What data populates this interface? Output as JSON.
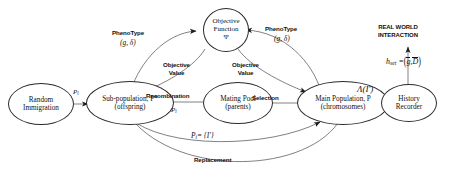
{
  "diagram": {
    "nodes": [
      {
        "id": "random-immigration",
        "lines": [
          "Random",
          "Immigration"
        ]
      },
      {
        "id": "sub-population",
        "lines": [
          "Sub-population, P*",
          "(offspring)"
        ]
      },
      {
        "id": "mating-pool",
        "lines": [
          "Mating Pool",
          "(parents)"
        ]
      },
      {
        "id": "main-population",
        "lines": [
          "Main Population, P",
          "(chromosomes)"
        ]
      },
      {
        "id": "objective-function",
        "lines": [
          "Objective",
          "Function",
          "Ψ"
        ]
      },
      {
        "id": "history-recorder",
        "lines": [
          "History",
          "Recorder"
        ]
      }
    ],
    "edge_labels": {
      "immigration_flow": "P",
      "immigration_flow_sub": "i",
      "phenotype_left": "PhenoType",
      "phenotype_left_formula": "(g, δ)",
      "phenotype_right": "PhenoType",
      "phenotype_right_formula": "(g, δ)",
      "objective_value_left": "Objective\nValue",
      "objective_value_left_l1": "Objective",
      "objective_value_left_l2": "Value",
      "objective_value_right_l1": "Objective",
      "objective_value_right_l2": "Value",
      "recombination": "Recombination",
      "recombination_formula": "P",
      "recombination_formula_sub": "i",
      "selection": "Selection",
      "lambda_record": "Λ(I')",
      "replacement": "Replacement",
      "pi_equals": "P",
      "pi_equals_sub": "i",
      "pi_equals_rest": "= {I'}",
      "real_world_l1": "REAL WORLD",
      "real_world_l2": "INTERACTION",
      "h_set_name": "h",
      "h_set_sub": "set",
      "h_set_eq": "=",
      "h_set_g": "g",
      "h_set_D": "D"
    },
    "colors": {
      "stroke": "#2b2b2b",
      "text": "#111111",
      "background": "#ffffff"
    }
  }
}
